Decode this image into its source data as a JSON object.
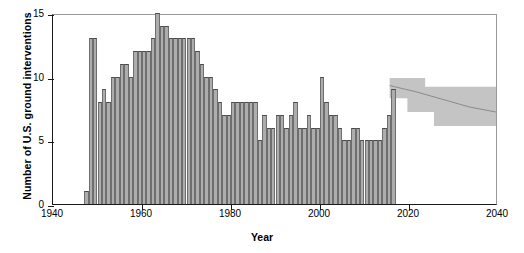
{
  "chart_data": {
    "type": "bar",
    "title": "",
    "xlabel": "Year",
    "ylabel": "Number of U.S. ground interventions",
    "xlim": [
      1940,
      2040
    ],
    "ylim": [
      0,
      15
    ],
    "xticks": [
      1940,
      1960,
      1980,
      2000,
      2020,
      2040
    ],
    "yticks": [
      0,
      5,
      10,
      15
    ],
    "grid": false,
    "legend": null,
    "bar_color": "#adadad",
    "bar_edge_color": "#6e6e6e",
    "band_color": "#c4c4c4",
    "axis_color": "#1a1a1a",
    "categories": [
      1947,
      1948,
      1949,
      1950,
      1951,
      1952,
      1953,
      1954,
      1955,
      1956,
      1957,
      1958,
      1959,
      1960,
      1961,
      1962,
      1963,
      1964,
      1965,
      1966,
      1967,
      1968,
      1969,
      1970,
      1971,
      1972,
      1973,
      1974,
      1975,
      1976,
      1977,
      1978,
      1979,
      1980,
      1981,
      1982,
      1983,
      1984,
      1985,
      1986,
      1987,
      1988,
      1989,
      1990,
      1991,
      1992,
      1993,
      1994,
      1995,
      1996,
      1997,
      1998,
      1999,
      2000,
      2001,
      2002,
      2003,
      2004,
      2005,
      2006,
      2007,
      2008,
      2009,
      2010,
      2011,
      2012,
      2013,
      2014,
      2015,
      2016
    ],
    "values": [
      1,
      13,
      13,
      8,
      9,
      8,
      10,
      10,
      11,
      11,
      10,
      12,
      12,
      12,
      12,
      13,
      15,
      14,
      14,
      13,
      13,
      13,
      13,
      13,
      13,
      12,
      11,
      10,
      10,
      9,
      8,
      7,
      7,
      8,
      8,
      8,
      8,
      8,
      8,
      5,
      7,
      6,
      6,
      7,
      7,
      6,
      7,
      8,
      6,
      6,
      7,
      6,
      6,
      10,
      8,
      7,
      7,
      6,
      5,
      5,
      6,
      6,
      5,
      5,
      5,
      5,
      5,
      6,
      7,
      9
    ],
    "projection": {
      "label": "forecast band",
      "x_start": 2016,
      "x_end": 2040,
      "upper_steps": [
        {
          "x": 2016,
          "y": 10.0
        },
        {
          "x": 2024,
          "y": 10.0
        },
        {
          "x": 2024,
          "y": 9.3
        },
        {
          "x": 2040,
          "y": 9.3
        }
      ],
      "lower_steps": [
        {
          "x": 2016,
          "y": 8.4
        },
        {
          "x": 2020,
          "y": 8.4
        },
        {
          "x": 2020,
          "y": 7.3
        },
        {
          "x": 2026,
          "y": 7.3
        },
        {
          "x": 2026,
          "y": 6.2
        },
        {
          "x": 2040,
          "y": 6.2
        }
      ],
      "median_line": [
        {
          "x": 2016,
          "y": 9.4
        },
        {
          "x": 2022,
          "y": 8.9
        },
        {
          "x": 2028,
          "y": 8.3
        },
        {
          "x": 2034,
          "y": 7.7
        },
        {
          "x": 2040,
          "y": 7.3
        }
      ]
    }
  },
  "axes": {
    "ylabel_text": "Number of U.S. ground interventions",
    "xlabel_text": "Year",
    "ytick_labels": [
      "0",
      "5",
      "10",
      "15"
    ],
    "xtick_labels": [
      "1940",
      "1960",
      "1980",
      "2000",
      "2020",
      "2040"
    ]
  }
}
